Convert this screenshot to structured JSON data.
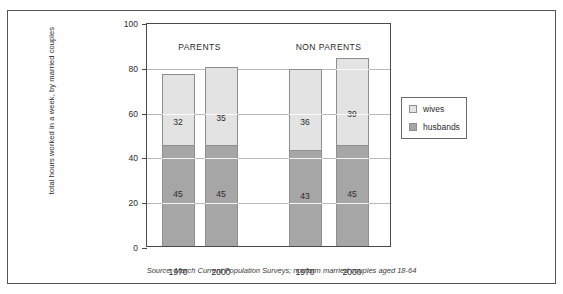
{
  "chart_data": {
    "type": "bar",
    "stacked": true,
    "title": "",
    "xlabel": "",
    "ylabel": "total hours worked in a week, by married couples",
    "ylim": [
      0,
      100
    ],
    "yticks": [
      0,
      20,
      40,
      60,
      80,
      100
    ],
    "grid": true,
    "legend_position": "right",
    "categories": [
      "1970",
      "2000",
      "1970",
      "2000"
    ],
    "groups": [
      {
        "label": "PARENTS",
        "categories": [
          "1970",
          "2000"
        ]
      },
      {
        "label": "NON PARENTS",
        "categories": [
          "1970",
          "2000"
        ]
      }
    ],
    "series": [
      {
        "name": "wives",
        "color": "#e3e3e3",
        "values": [
          32,
          35,
          36,
          39
        ]
      },
      {
        "name": "husbands",
        "color": "#a6a6a6",
        "values": [
          45,
          45,
          43,
          45
        ]
      }
    ],
    "totals": [
      77,
      80,
      79,
      84
    ],
    "source": "Source: March Current Population Surveys; nonfarm married couples aged 18-64"
  },
  "legend": {
    "entries": [
      {
        "label": "wives"
      },
      {
        "label": "husbands"
      }
    ]
  }
}
